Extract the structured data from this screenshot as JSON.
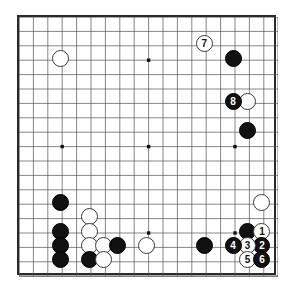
{
  "figure": {
    "kind": "go-board-diagram",
    "title": "Go board position diagram",
    "board_size": 19,
    "colors": {
      "board_background": "#ffffff",
      "board_border": "#2b2b2b",
      "grid_line": "#555555",
      "star_point": "#111111",
      "black_stone": "#111111",
      "white_stone": "#ffffff",
      "white_stone_outline": "#3a3a3a",
      "black_stone_label": "#ffffff",
      "white_stone_label": "#111111"
    },
    "geometry": {
      "origin_x": 17,
      "origin_y": 15,
      "cell_size": 14.4,
      "stone_diameter": 17,
      "board_width": 259,
      "board_height": 260
    },
    "star_points": [
      {
        "col": 3,
        "row": 3
      },
      {
        "col": 9,
        "row": 3
      },
      {
        "col": 15,
        "row": 3
      },
      {
        "col": 3,
        "row": 9
      },
      {
        "col": 9,
        "row": 9
      },
      {
        "col": 15,
        "row": 9
      },
      {
        "col": 3,
        "row": 15
      },
      {
        "col": 9,
        "row": 15
      },
      {
        "col": 15,
        "row": 15
      }
    ]
  },
  "stones": [
    {
      "id": "w-tl-star",
      "color": "white",
      "col": 3,
      "row": 3,
      "label": ""
    },
    {
      "id": "b-r-1",
      "color": "black",
      "col": 15,
      "row": 3,
      "label": ""
    },
    {
      "id": "w-r-1",
      "color": "white",
      "col": 16,
      "row": 6,
      "label": ""
    },
    {
      "id": "b-r-2",
      "color": "black",
      "col": 16,
      "row": 8,
      "label": ""
    },
    {
      "id": "w-lr-side",
      "color": "white",
      "col": 17,
      "row": 13,
      "label": ""
    },
    {
      "id": "b-bl-1",
      "color": "black",
      "col": 3,
      "row": 13,
      "label": ""
    },
    {
      "id": "w-bl-1",
      "color": "white",
      "col": 5,
      "row": 14,
      "label": ""
    },
    {
      "id": "b-bl-2",
      "color": "black",
      "col": 3,
      "row": 15,
      "label": ""
    },
    {
      "id": "w-bl-2",
      "color": "white",
      "col": 5,
      "row": 15,
      "label": ""
    },
    {
      "id": "b-bl-3",
      "color": "black",
      "col": 3,
      "row": 16,
      "label": ""
    },
    {
      "id": "w-bl-3",
      "color": "white",
      "col": 5,
      "row": 16,
      "label": ""
    },
    {
      "id": "w-bl-4",
      "color": "white",
      "col": 6,
      "row": 16,
      "label": ""
    },
    {
      "id": "b-bl-4",
      "color": "black",
      "col": 7,
      "row": 16,
      "label": ""
    },
    {
      "id": "b-bl-5",
      "color": "black",
      "col": 3,
      "row": 17,
      "label": ""
    },
    {
      "id": "b-bl-6",
      "color": "black",
      "col": 5,
      "row": 17,
      "label": ""
    },
    {
      "id": "w-bl-5",
      "color": "white",
      "col": 6,
      "row": 17,
      "label": ""
    },
    {
      "id": "w-bottom-1",
      "color": "white",
      "col": 9,
      "row": 16,
      "label": ""
    },
    {
      "id": "b-bottom-1",
      "color": "black",
      "col": 13,
      "row": 16,
      "label": ""
    },
    {
      "id": "b-br-1",
      "color": "black",
      "col": 16,
      "row": 15,
      "label": ""
    },
    {
      "id": "move-1",
      "color": "white",
      "col": 17,
      "row": 15,
      "label": "1"
    },
    {
      "id": "move-2",
      "color": "black",
      "col": 17,
      "row": 16,
      "label": "2"
    },
    {
      "id": "move-3",
      "color": "white",
      "col": 16,
      "row": 16,
      "label": "3"
    },
    {
      "id": "move-4",
      "color": "black",
      "col": 15,
      "row": 16,
      "label": "4"
    },
    {
      "id": "move-5",
      "color": "white",
      "col": 16,
      "row": 17,
      "label": "5"
    },
    {
      "id": "move-6",
      "color": "black",
      "col": 17,
      "row": 17,
      "label": "6"
    },
    {
      "id": "move-7",
      "color": "white",
      "col": 13,
      "row": 2,
      "label": "7"
    },
    {
      "id": "move-8",
      "color": "black",
      "col": 15,
      "row": 6,
      "label": "8"
    }
  ]
}
